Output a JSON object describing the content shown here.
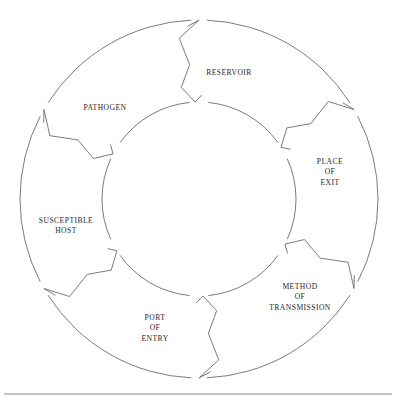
{
  "diagram": {
    "type": "cycle",
    "orientation": "clockwise",
    "geometry": {
      "center_x": 199,
      "center_y": 199,
      "outer_radius": 179,
      "inner_radius": 97
    },
    "colors": {
      "stroke": "#6b6b6b",
      "text": "#262626",
      "background": "#ffffff",
      "rule": "#8a8a8a"
    },
    "segments": [
      {
        "id": "reservoir",
        "label": "RESERVOIR",
        "lines": [
          "RESERVOIR"
        ],
        "label_x": 229,
        "label_y": 73,
        "order": 1
      },
      {
        "id": "place-of-exit",
        "label": "PLACE OF EXIT",
        "lines": [
          "PLACE",
          "OF",
          "EXIT"
        ],
        "label_x": 330,
        "label_y": 172,
        "order": 2
      },
      {
        "id": "method-of-transmission",
        "label": "METHOD OF TRANSMISSION",
        "lines": [
          "METHOD",
          "OF",
          "TRANSMISSION"
        ],
        "label_x": 300,
        "label_y": 297,
        "order": 3
      },
      {
        "id": "port-of-entry",
        "label": "PORT OF ENTRY",
        "lines": [
          "PORT",
          "OF",
          "ENTRY"
        ],
        "label_x": 155,
        "label_y": 328,
        "order": 4
      },
      {
        "id": "susceptible-host",
        "label": "SUSCEPTIBLE HOST",
        "lines": [
          "SUSCEPTIBLE",
          "HOST"
        ],
        "label_x": 66,
        "label_y": 226,
        "order": 5
      },
      {
        "id": "pathogen",
        "label": "PATHOGEN",
        "lines": [
          "PATHOGEN"
        ],
        "label_x": 105,
        "label_y": 108,
        "order": 6
      }
    ],
    "arrows": [
      {
        "id": "arrow-top",
        "between": "pathogen-to-reservoir",
        "angle_deg": -90
      },
      {
        "id": "arrow-upper-right",
        "between": "reservoir-to-place-of-exit",
        "angle_deg": -30
      },
      {
        "id": "arrow-lower-right",
        "between": "place-of-exit-to-method-of-transmission",
        "angle_deg": 30
      },
      {
        "id": "arrow-bottom",
        "between": "method-of-transmission-to-port-of-entry",
        "angle_deg": 90
      },
      {
        "id": "arrow-lower-left",
        "between": "port-of-entry-to-susceptible-host",
        "angle_deg": 150
      },
      {
        "id": "arrow-upper-left",
        "between": "susceptible-host-to-pathogen",
        "angle_deg": 210
      }
    ],
    "footer_rule": {
      "id": "baseline-rule",
      "x1": 4,
      "x2": 392,
      "y": 394
    }
  }
}
